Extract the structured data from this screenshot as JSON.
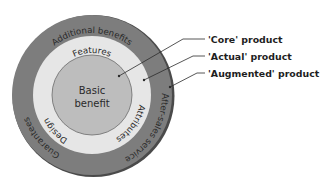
{
  "diagram": {
    "colors": {
      "augmented_ring": "#7d7d7d",
      "actual_ring": "#e6e6e6",
      "core": "#bdbdbd",
      "text": "#2a2a2a",
      "lines": "#2b2b2b"
    },
    "core": {
      "line1": "Basic",
      "line2": "benefit"
    },
    "actual_ring": {
      "top": "Features",
      "left": "Design",
      "right": "Attributes"
    },
    "augmented_ring": {
      "top": "Additional benefits",
      "left": "Guarantees",
      "right": "After-sales service"
    },
    "legend": [
      {
        "label": "'Core' product"
      },
      {
        "label": "'Actual' product"
      },
      {
        "label": "'Augmented' product"
      }
    ]
  }
}
